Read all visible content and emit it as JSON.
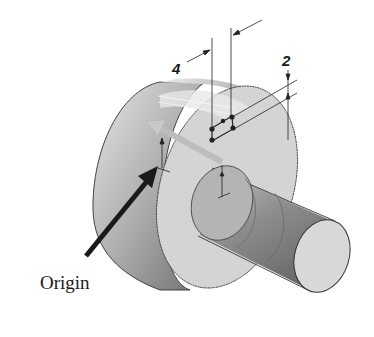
{
  "figure": {
    "type": "isometric CAD part drawing",
    "labels": {
      "origin": "Origin",
      "dimension_width": "4",
      "dimension_height": "2"
    },
    "colors": {
      "background": "#ffffff",
      "outline": "#333333",
      "face_light": "#d6d6d6",
      "body_dark": "#8c8c8c",
      "arrow": "#1a1a1a",
      "extrude_arrow": "#bdbdbd"
    }
  }
}
